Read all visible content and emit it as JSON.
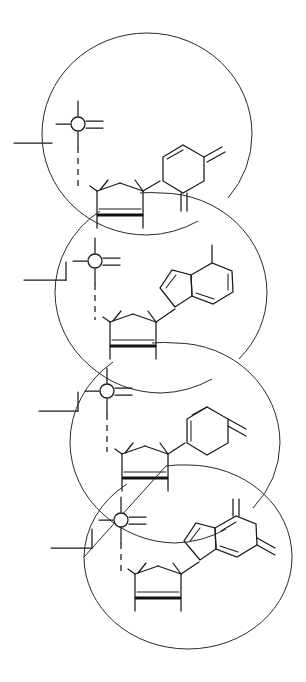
{
  "figure": {
    "background_color": "#ffffff",
    "line_color": "#1a1a1a",
    "envelope_color": "#2a2a2a",
    "width": 306,
    "height": 682
  },
  "legend": {
    "phosphate_symbol": "open circle with four bonds",
    "sugar_symbol": "five-membered furanose ring with bold wedge base",
    "stereo_bond": "bold wedge",
    "linkage_bond": "dashed vertical"
  },
  "residues": [
    {
      "index": 1,
      "label": "residue-1",
      "envelope": {
        "cx": 147,
        "cy": 134,
        "rx": 105,
        "ry": 101
      },
      "phosphate": {
        "cx": 78,
        "cy": 124,
        "r": 7,
        "bond_up": "single",
        "bond_right": "double",
        "bond_left": "single",
        "bond_down": "dashed"
      },
      "terminal_bond": {
        "x1": 14,
        "y1": 143,
        "x2": 52,
        "y2": 143
      },
      "sugar": {
        "cx": 120,
        "cy": 200,
        "r": 26
      },
      "base": {
        "type": "pyrimidine",
        "rings": 1,
        "cx": 182,
        "cy": 168,
        "exocyclic_double_bonds": 2
      }
    },
    {
      "index": 2,
      "label": "residue-2",
      "envelope": {
        "cx": 161,
        "cy": 293,
        "rx": 106,
        "ry": 100
      },
      "phosphate": {
        "cx": 95,
        "cy": 261,
        "r": 7,
        "bond_up": "single",
        "bond_right": "double",
        "bond_left": "single",
        "bond_down": "dashed"
      },
      "terminal_bond": {
        "x1": 24,
        "y1": 280,
        "x2": 66,
        "y2": 280
      },
      "sugar": {
        "cx": 133,
        "cy": 331,
        "r": 26
      },
      "base": {
        "type": "purine",
        "rings": 2,
        "cx": 198,
        "cy": 295,
        "exocyclic_double_bonds": 1
      }
    },
    {
      "index": 3,
      "label": "residue-3",
      "envelope": {
        "cx": 175,
        "cy": 443,
        "rx": 105,
        "ry": 100
      },
      "phosphate": {
        "cx": 107,
        "cy": 391,
        "r": 7,
        "bond_up": "single",
        "bond_right": "double",
        "bond_left": "single",
        "bond_down": "dashed"
      },
      "terminal_bond": {
        "x1": 39,
        "y1": 411,
        "x2": 78,
        "y2": 411
      },
      "sugar": {
        "cx": 145,
        "cy": 463,
        "r": 26
      },
      "base": {
        "type": "pyrimidine",
        "rings": 1,
        "cx": 205,
        "cy": 420,
        "exocyclic_double_bonds": 2
      }
    },
    {
      "index": 4,
      "label": "residue-4",
      "envelope": {
        "cx": 188,
        "cy": 557,
        "rx": 104,
        "ry": 92
      },
      "phosphate": {
        "cx": 121,
        "cy": 520,
        "r": 7,
        "bond_up": "single",
        "bond_right": "double",
        "bond_left": "single",
        "bond_down": "dashed"
      },
      "terminal_bond": {
        "x1": 51,
        "y1": 548,
        "x2": 92,
        "y2": 548
      },
      "sugar": {
        "cx": 158,
        "cy": 583,
        "r": 26
      },
      "base": {
        "type": "purine",
        "rings": 2,
        "cx": 224,
        "cy": 550,
        "exocyclic_double_bonds": 2
      }
    }
  ]
}
